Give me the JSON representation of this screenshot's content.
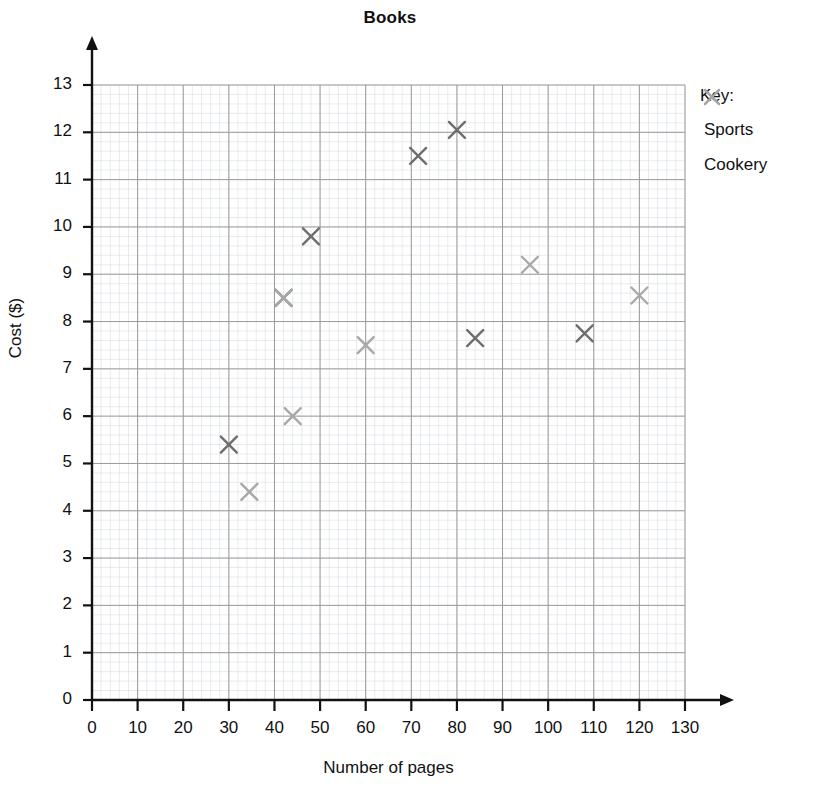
{
  "chart_data": {
    "type": "scatter",
    "title": "Books",
    "xlabel": "Number of pages",
    "ylabel": "Cost ($)",
    "xlim": [
      0,
      130
    ],
    "ylim": [
      0,
      13
    ],
    "xticks": [
      "0",
      "10",
      "20",
      "30",
      "40",
      "50",
      "60",
      "70",
      "80",
      "90",
      "100",
      "110",
      "120",
      "130"
    ],
    "yticks": [
      "0",
      "1",
      "2",
      "3",
      "4",
      "5",
      "6",
      "7",
      "8",
      "9",
      "10",
      "11",
      "12",
      "13"
    ],
    "grid": true,
    "grid_minor": true,
    "legend_position": "right",
    "series": [
      {
        "name": "Sports",
        "color": "#6e6e6e",
        "marker": "x",
        "points": [
          {
            "x": 30,
            "y": 5.4
          },
          {
            "x": 42,
            "y": 8.5
          },
          {
            "x": 48,
            "y": 9.8
          },
          {
            "x": 71.5,
            "y": 11.5
          },
          {
            "x": 80,
            "y": 12.05
          },
          {
            "x": 84,
            "y": 7.65
          },
          {
            "x": 108,
            "y": 7.75
          }
        ]
      },
      {
        "name": "Cookery",
        "color": "#a8a8a8",
        "marker": "x",
        "points": [
          {
            "x": 34.5,
            "y": 4.4
          },
          {
            "x": 42,
            "y": 8.5
          },
          {
            "x": 44,
            "y": 6.0
          },
          {
            "x": 60,
            "y": 7.5
          },
          {
            "x": 96,
            "y": 9.2
          },
          {
            "x": 120,
            "y": 8.55
          }
        ]
      }
    ]
  },
  "legend": {
    "title": "Key:",
    "entries": [
      {
        "label": "Sports",
        "color": "#6e6e6e"
      },
      {
        "label": "Cookery",
        "color": "#a8a8a8"
      }
    ]
  },
  "colors": {
    "axis": "#111111",
    "grid_major": "#9a9a9a",
    "grid_minor": "#d8dde3",
    "sports": "#6e6e6e",
    "cookery": "#a8a8a8",
    "background": "#ffffff"
  }
}
